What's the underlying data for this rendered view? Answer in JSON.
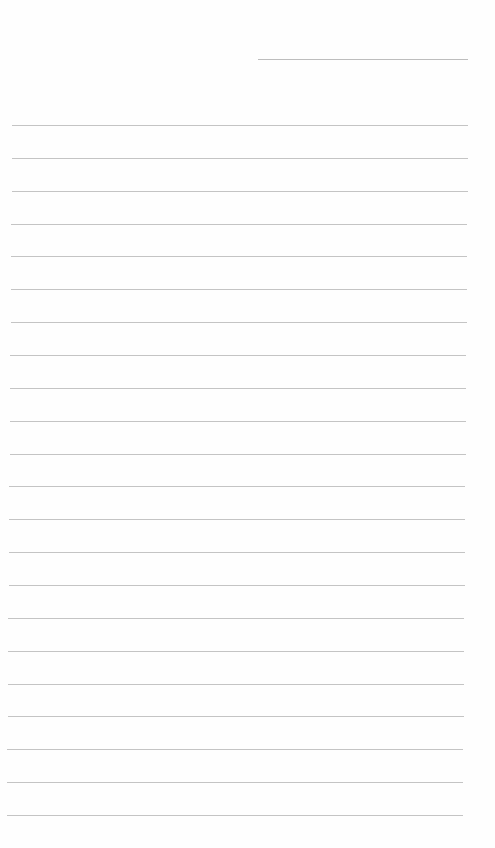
{
  "paper": {
    "type": "lined-notebook-page",
    "background_color": "#fefefe",
    "line_color": "#c4c4c4",
    "header_line": {
      "present": true
    },
    "ruled_line_count": 22,
    "text": ""
  }
}
